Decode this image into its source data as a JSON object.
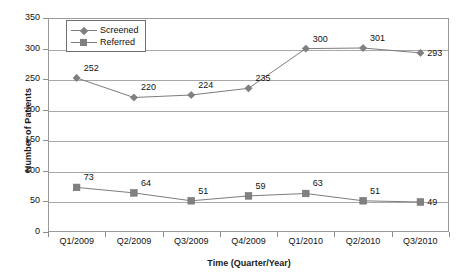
{
  "chart_data": {
    "type": "line",
    "title": "",
    "xlabel": "Time (Quarter/Year)",
    "ylabel": "Number of Patients",
    "categories": [
      "Q1/2009",
      "Q2/2009",
      "Q3/2009",
      "Q4/2009",
      "Q1/2010",
      "Q2/2010",
      "Q3/2010"
    ],
    "series": [
      {
        "name": "Screened",
        "marker": "diamond",
        "values": [
          252,
          220,
          224,
          235,
          300,
          301,
          293
        ]
      },
      {
        "name": "Referred",
        "marker": "square",
        "values": [
          73,
          64,
          51,
          59,
          63,
          51,
          49
        ]
      }
    ],
    "ylim": [
      0,
      350
    ],
    "ytick_values": [
      0,
      50,
      100,
      150,
      200,
      250,
      300,
      350
    ],
    "ytick_labels": [
      "0",
      "50",
      "100",
      "150",
      "200",
      "250",
      "300",
      "350"
    ],
    "grid": "horizontal",
    "legend_position": "top-left",
    "colors": {
      "series_line": "#7d7d7d",
      "marker": "#808080",
      "gridline": "#a8a8a8",
      "axis": "#9a9a9a",
      "text": "#111111",
      "background": "#ffffff"
    }
  }
}
